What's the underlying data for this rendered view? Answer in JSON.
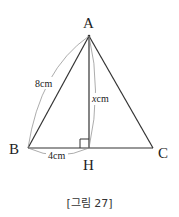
{
  "diagram": {
    "type": "triangle-altitude",
    "vertices": {
      "A": "A",
      "B": "B",
      "C": "C",
      "H": "H"
    },
    "labels": {
      "AB": "8cm",
      "AH": "xcm",
      "AH_var": "x",
      "AH_unit": "cm",
      "BH": "4cm"
    },
    "right_angle_at": "H"
  },
  "caption": "[그림 27]"
}
